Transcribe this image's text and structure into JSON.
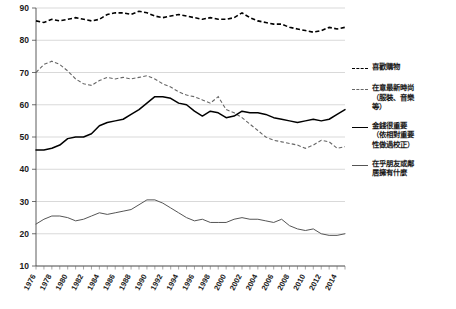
{
  "chart_data": {
    "type": "line",
    "title": "",
    "xlabel": "",
    "ylabel": "",
    "ylim": [
      10,
      90
    ],
    "xlim": [
      1976,
      2015
    ],
    "grid": true,
    "legend_position": "right",
    "yticks": [
      10,
      20,
      30,
      40,
      50,
      60,
      70,
      80,
      90
    ],
    "xticks": [
      1976,
      1978,
      1980,
      1982,
      1984,
      1986,
      1988,
      1990,
      1992,
      1994,
      1996,
      1998,
      2000,
      2002,
      2004,
      2006,
      2008,
      2010,
      2012,
      2014
    ],
    "x": [
      1976,
      1977,
      1978,
      1979,
      1980,
      1981,
      1982,
      1983,
      1984,
      1985,
      1986,
      1987,
      1988,
      1989,
      1990,
      1991,
      1992,
      1993,
      1994,
      1995,
      1996,
      1997,
      1998,
      1999,
      2000,
      2001,
      2002,
      2003,
      2004,
      2005,
      2006,
      2007,
      2008,
      2009,
      2010,
      2011,
      2012,
      2013,
      2014,
      2015
    ],
    "series": [
      {
        "name": "喜歡購物",
        "style": "dashed-heavy",
        "color": "#000000",
        "values": [
          86.0,
          85.5,
          86.5,
          86.0,
          86.5,
          87.0,
          86.5,
          86.0,
          86.5,
          88.0,
          88.5,
          88.5,
          88.0,
          89.0,
          88.5,
          87.5,
          87.0,
          87.5,
          88.0,
          87.5,
          87.0,
          86.5,
          87.0,
          86.5,
          86.5,
          87.0,
          88.5,
          87.0,
          86.0,
          85.5,
          85.0,
          85.0,
          84.0,
          83.5,
          83.0,
          82.5,
          83.0,
          84.0,
          83.5,
          84.0
        ]
      },
      {
        "name": "在意最新時尚\n（服裝、音樂\n等）",
        "style": "dashed-light",
        "color": "#666666",
        "values": [
          70.0,
          72.5,
          73.5,
          72.5,
          70.5,
          68.0,
          66.5,
          66.0,
          67.5,
          68.5,
          68.0,
          68.5,
          68.0,
          68.5,
          69.0,
          68.0,
          66.5,
          65.5,
          64.0,
          63.0,
          62.5,
          61.5,
          60.5,
          62.5,
          58.5,
          57.5,
          56.0,
          54.0,
          52.0,
          50.0,
          49.0,
          48.5,
          48.0,
          47.5,
          46.5,
          47.5,
          49.0,
          48.5,
          46.5,
          47.0
        ]
      },
      {
        "name": "金錢很重要\n（依相對重要\n性做過校正）",
        "style": "solid",
        "color": "#000000",
        "values": [
          46.0,
          46.0,
          46.5,
          47.5,
          49.5,
          50.0,
          50.0,
          51.0,
          53.5,
          54.5,
          55.0,
          55.5,
          57.0,
          58.5,
          60.5,
          62.5,
          62.5,
          62.0,
          60.5,
          60.0,
          58.0,
          56.5,
          58.0,
          57.5,
          56.0,
          56.5,
          58.0,
          57.5,
          57.5,
          57.0,
          56.0,
          55.5,
          55.0,
          54.5,
          55.0,
          55.5,
          55.0,
          55.5,
          57.0,
          58.5
        ]
      },
      {
        "name": "在乎朋友或鄰\n居擁有什麼",
        "style": "solid-thin",
        "color": "#555555",
        "values": [
          23.0,
          24.5,
          25.5,
          25.5,
          25.0,
          24.0,
          24.5,
          25.5,
          26.5,
          26.0,
          26.5,
          27.0,
          27.5,
          29.0,
          30.5,
          30.5,
          29.5,
          28.0,
          26.5,
          25.0,
          24.0,
          24.5,
          23.5,
          23.5,
          23.5,
          24.5,
          25.0,
          24.5,
          24.5,
          24.0,
          23.5,
          24.5,
          22.5,
          21.5,
          21.0,
          21.5,
          20.0,
          19.5,
          19.5,
          20.0
        ]
      }
    ]
  },
  "legend": {
    "items": [
      {
        "label": "喜歡購物",
        "style": "dashed-heavy"
      },
      {
        "label": "在意最新時尚\n（服裝、音樂\n等）",
        "style": "dashed-light"
      },
      {
        "label": "金錢很重要\n（依相對重要\n性做過校正）",
        "style": "solid"
      },
      {
        "label": "在乎朋友或鄰\n居擁有什麼",
        "style": "solid-thin"
      }
    ]
  },
  "colors": {
    "grid": "#c9c9c9",
    "axis": "#4a4a4a",
    "background": "#ffffff",
    "series_primary": "#000000",
    "series_secondary": "#666666"
  }
}
